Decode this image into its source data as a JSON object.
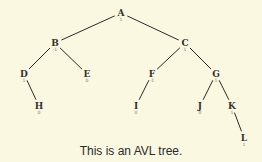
{
  "caption": "This is an AVL tree.",
  "colors": {
    "background": "#fbf8e1",
    "edge": "#2a2a2a",
    "node_text": "#333333",
    "balance_text": "#777777"
  },
  "tree": {
    "nodes": [
      {
        "id": "A",
        "label": "A",
        "balance": "1",
        "x": 121,
        "y": 13
      },
      {
        "id": "B",
        "label": "B",
        "balance": "-1",
        "x": 55,
        "y": 43
      },
      {
        "id": "C",
        "label": "C",
        "balance": "1",
        "x": 185,
        "y": 43
      },
      {
        "id": "D",
        "label": "D",
        "balance": "1",
        "x": 24,
        "y": 74
      },
      {
        "id": "E",
        "label": "E",
        "balance": "0",
        "x": 87,
        "y": 74
      },
      {
        "id": "F",
        "label": "F",
        "balance": "-1",
        "x": 152,
        "y": 74
      },
      {
        "id": "G",
        "label": "G",
        "balance": "1",
        "x": 216,
        "y": 74
      },
      {
        "id": "H",
        "label": "H",
        "balance": "0",
        "x": 39,
        "y": 106
      },
      {
        "id": "I",
        "label": "I",
        "balance": "0",
        "x": 136,
        "y": 106
      },
      {
        "id": "J",
        "label": "J",
        "balance": "0",
        "x": 200,
        "y": 106
      },
      {
        "id": "K",
        "label": "K",
        "balance": "1",
        "x": 232,
        "y": 106
      },
      {
        "id": "L",
        "label": "L",
        "balance": "1",
        "x": 244,
        "y": 138
      }
    ],
    "edges": [
      [
        "A",
        "B"
      ],
      [
        "A",
        "C"
      ],
      [
        "B",
        "D"
      ],
      [
        "B",
        "E"
      ],
      [
        "C",
        "F"
      ],
      [
        "C",
        "G"
      ],
      [
        "D",
        "H"
      ],
      [
        "F",
        "I"
      ],
      [
        "G",
        "J"
      ],
      [
        "G",
        "K"
      ],
      [
        "K",
        "L"
      ]
    ]
  }
}
